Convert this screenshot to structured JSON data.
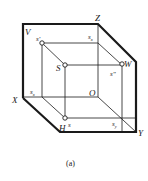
{
  "figure": {
    "caption": "(a)",
    "colors": {
      "line": "#1a1a1a",
      "background": "#ffffff"
    },
    "axes": {
      "V": "V",
      "X": "X",
      "Z": "Z",
      "W": "W",
      "Y": "Y",
      "H": "H",
      "O": "O"
    },
    "projections": {
      "s_prime": "s'",
      "s_double_prime": "s\"",
      "s_h": "s",
      "S": "S",
      "s_x_top": "s",
      "s_x_top_sub": "x",
      "s_x_left": "s",
      "s_x_left_sub": "x",
      "s_y": "s",
      "s_y_sub": "y"
    }
  }
}
